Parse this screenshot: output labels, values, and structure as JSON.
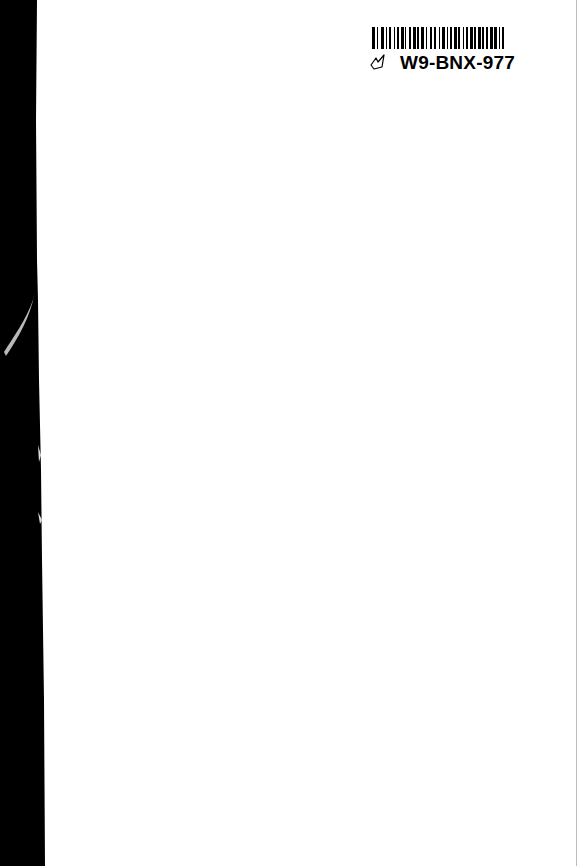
{
  "page": {
    "type": "scanned-blank-page",
    "background_color": "#ffffff",
    "binding_edge_color": "#000000"
  },
  "barcode_label": {
    "id_text": "W9-BNX-977",
    "mark_icon": "hand-drawn-check-mark-icon",
    "bar_pattern": [
      3,
      2,
      1,
      3,
      3,
      2,
      1,
      2,
      2,
      3,
      1,
      2,
      2,
      2,
      3,
      1,
      1,
      3,
      2,
      2,
      3,
      1,
      2,
      2,
      3,
      2,
      1,
      3,
      2,
      2,
      2,
      3,
      1,
      2,
      3,
      2,
      1,
      2,
      2,
      2,
      3,
      1,
      2,
      3,
      1,
      2,
      2,
      2,
      3,
      1,
      2,
      2,
      3,
      1,
      2,
      2,
      2,
      2,
      3,
      1,
      3,
      2,
      1,
      2,
      2,
      3
    ]
  }
}
